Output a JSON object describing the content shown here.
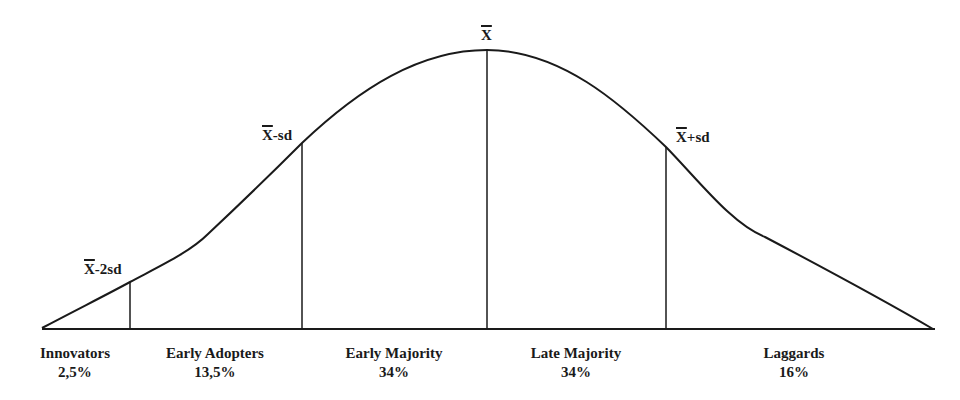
{
  "diagram": {
    "type": "bell-curve",
    "markers": [
      {
        "id": "mean-minus-2sd",
        "symbol": "X",
        "suffix": "-2sd"
      },
      {
        "id": "mean-minus-sd",
        "symbol": "X",
        "suffix": "-sd"
      },
      {
        "id": "mean",
        "symbol": "X",
        "suffix": ""
      },
      {
        "id": "mean-plus-sd",
        "symbol": "X",
        "suffix": "+sd"
      }
    ],
    "segments": [
      {
        "name": "Innovators",
        "percent": "2,5%"
      },
      {
        "name": "Early Adopters",
        "percent": "13,5%"
      },
      {
        "name": "Early Majority",
        "percent": "34%"
      },
      {
        "name": "Late Majority",
        "percent": "34%"
      },
      {
        "name": "Laggards",
        "percent": "16%"
      }
    ],
    "colors": {
      "line": "#1a1a1a",
      "background": "#ffffff"
    }
  }
}
